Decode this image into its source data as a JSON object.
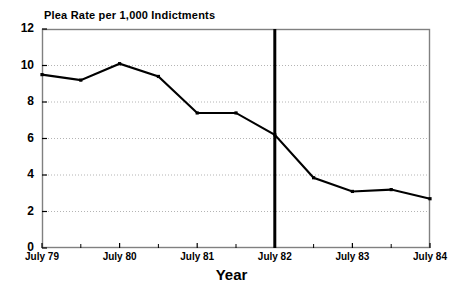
{
  "chart_data": {
    "type": "line",
    "title": "Plea Rate per 1,000 Indictments",
    "xlabel": "Year",
    "ylabel": "",
    "ylim": [
      0,
      12
    ],
    "ytick_labels": [
      "0",
      "2",
      "4",
      "6",
      "8",
      "10",
      "12"
    ],
    "ytick_values": [
      0,
      2,
      4,
      6,
      8,
      10,
      12
    ],
    "xtick_labels": [
      "July 79",
      "July 80",
      "July 81",
      "July 82",
      "July 83",
      "July 84"
    ],
    "xtick_values": [
      0,
      2,
      4,
      6,
      8,
      10
    ],
    "minor_xticks": true,
    "grid": "horizontal-dotted",
    "legend": "none",
    "x": [
      0,
      1,
      2,
      3,
      4,
      5,
      6,
      7,
      8,
      9,
      10
    ],
    "x_period_labels": [
      "July 79",
      "Jan 80",
      "July 80",
      "Jan 81",
      "July 81",
      "Jan 82",
      "July 82",
      "Jan 83",
      "July 83",
      "Jan 84",
      "July 84"
    ],
    "values": [
      9.5,
      9.2,
      10.1,
      9.4,
      7.4,
      7.4,
      6.2,
      3.85,
      3.1,
      3.2,
      2.7
    ],
    "markers": true,
    "line_color": "#000000",
    "annotations": [
      {
        "type": "vertical-line",
        "name": "july-82-reference-line",
        "x": 6,
        "label": "July 82",
        "color": "#000000"
      }
    ]
  },
  "colors": {
    "background": "#ffffff",
    "axis": "#808080",
    "grid": "#b4b4b4",
    "series": "#000000",
    "text": "#000000"
  }
}
